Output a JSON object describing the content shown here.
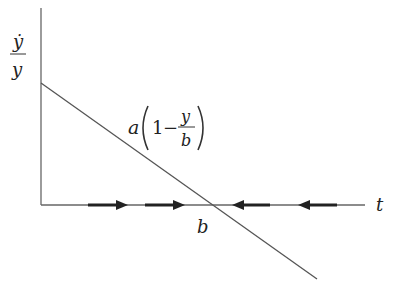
{
  "diagram": {
    "y_axis_label": {
      "numerator": "ẏ",
      "denominator": "y"
    },
    "x_axis_label": "t",
    "line_label": {
      "coef": "a",
      "one": "1",
      "minus": "−",
      "num": "y",
      "den": "b"
    },
    "intercept_label": "b",
    "arrows": [
      {
        "direction": "right",
        "x1": 88,
        "x2": 128
      },
      {
        "direction": "right",
        "x1": 145,
        "x2": 185
      },
      {
        "direction": "left",
        "x1": 270,
        "x2": 232
      },
      {
        "direction": "left",
        "x1": 337,
        "x2": 298
      }
    ],
    "colors": {
      "axis": "#666666",
      "line": "#555555",
      "arrow": "#222222"
    }
  }
}
